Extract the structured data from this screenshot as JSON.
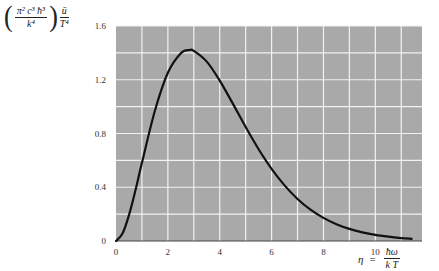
{
  "chart_data": {
    "type": "line",
    "title": "",
    "ylabel": {
      "prefactor_numerator": "π² c³ ħ³",
      "prefactor_denominator": "k⁴",
      "quantity_numerator": "ū",
      "quantity_denominator": "T⁴"
    },
    "xlabel": {
      "symbol": "η",
      "equals": "=",
      "numerator": "ħω",
      "denominator": "k T"
    },
    "xlim": [
      0,
      11.8
    ],
    "ylim": [
      0,
      1.6
    ],
    "x_ticks": [
      0,
      2,
      4,
      6,
      8,
      10
    ],
    "x_tick_labels": [
      "0",
      "2",
      "4",
      "6",
      "8",
      "10"
    ],
    "y_ticks": [
      0,
      0.4,
      0.8,
      1.2,
      1.6
    ],
    "y_tick_labels": [
      "0",
      "0.4",
      "0.8",
      "1.2",
      "1.6"
    ],
    "grid": true,
    "grid_x_step": 1,
    "grid_y_step": 0.2,
    "colors": {
      "plot_bg": "#a9a9a9",
      "grid": "#f2f2f2",
      "curve": "#111111",
      "axis": "#444444"
    },
    "series": [
      {
        "name": "η³/(e^η − 1)",
        "x": [
          0,
          0.25,
          0.5,
          0.75,
          1,
          1.5,
          2,
          2.5,
          2.82,
          3,
          3.5,
          4,
          4.5,
          5,
          5.5,
          6,
          6.5,
          7,
          7.5,
          8,
          8.5,
          9,
          9.5,
          10,
          10.5,
          11,
          11.4
        ],
        "y": [
          0,
          0.055,
          0.193,
          0.377,
          0.582,
          0.969,
          1.252,
          1.397,
          1.421,
          1.415,
          1.335,
          1.194,
          1.024,
          0.848,
          0.683,
          0.537,
          0.414,
          0.313,
          0.233,
          0.172,
          0.125,
          0.09,
          0.064,
          0.045,
          0.032,
          0.022,
          0.016
        ]
      }
    ]
  }
}
